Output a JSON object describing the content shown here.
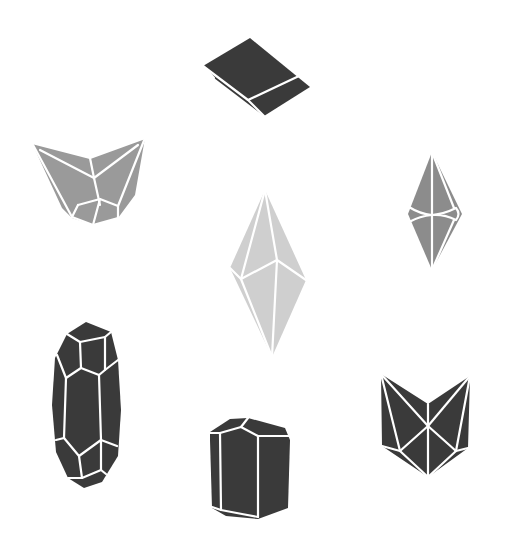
{
  "figure": {
    "background": "#ffffff",
    "edge_color": "#ffffff",
    "crystals": [
      {
        "id": "tabular-top",
        "fill": "#3a3a3a",
        "position": "top-center"
      },
      {
        "id": "funnel-left",
        "fill": "#9a9a9a",
        "position": "upper-left"
      },
      {
        "id": "bipyramid-center",
        "fill": "#cfcfcf",
        "position": "center"
      },
      {
        "id": "dipyramid-right",
        "fill": "#8c8c8c",
        "position": "upper-right"
      },
      {
        "id": "elongated-prism-left",
        "fill": "#3a3a3a",
        "position": "lower-left"
      },
      {
        "id": "short-prism-bottom",
        "fill": "#3a3a3a",
        "position": "bottom-center"
      },
      {
        "id": "twin-right",
        "fill": "#3a3a3a",
        "position": "lower-right"
      }
    ]
  }
}
